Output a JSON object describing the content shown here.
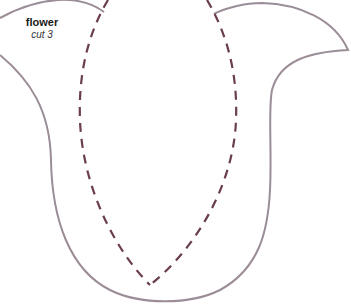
{
  "pattern": {
    "title": "flower",
    "instruction": "cut 3",
    "outline_color": "#9b8d97",
    "fold_line_color": "#6a3d4f"
  }
}
